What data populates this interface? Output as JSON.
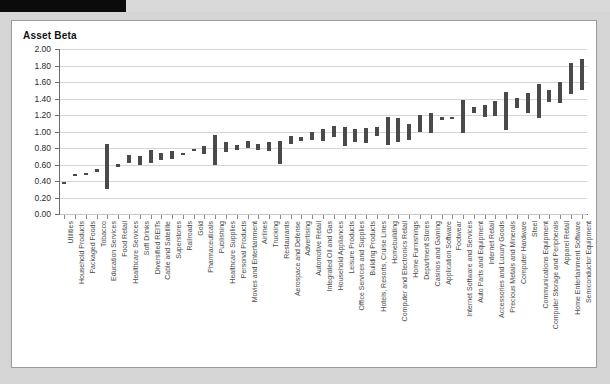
{
  "redaction": {
    "present": true
  },
  "figure": {
    "title": "Asset Beta"
  },
  "chart_data": {
    "type": "bar",
    "subtype": "floating-range-bar",
    "title": "Asset Beta",
    "xlabel": "",
    "ylabel": "Asset Beta",
    "ylim": [
      0.0,
      2.0
    ],
    "ytick_labels": [
      "0.00",
      "0.20",
      "0.40",
      "0.60",
      "0.80",
      "1.00",
      "1.20",
      "1.40",
      "1.60",
      "1.80",
      "2.00"
    ],
    "ytick_values": [
      0.0,
      0.2,
      0.4,
      0.6,
      0.8,
      1.0,
      1.2,
      1.4,
      1.6,
      1.8,
      2.0
    ],
    "grid": true,
    "legend": "none",
    "categories": [
      "Utilities",
      "Household Products",
      "Packaged Foods",
      "Tobacco",
      "Education Services",
      "Food Retail",
      "Healthcare Services",
      "Soft Drinks",
      "Diversified REITs",
      "Cable and Satellite",
      "Superstores",
      "Railroads",
      "Gold",
      "Pharmaceuticals",
      "Publishing",
      "Healthcare Supplies",
      "Personal Products",
      "Movies and Entertainment",
      "Airlines",
      "Trucking",
      "Restaurants",
      "Aerospace and Defense",
      "Advertising",
      "Automotive Retail",
      "Integrated Oil and Gas",
      "Household Appliances",
      "Leisure Products",
      "Office Services and Supplies",
      "Building Products",
      "Hotels, Resorts, Cruise Lines",
      "Homebuilding",
      "Computer and Electronics Retail",
      "Home Furnishings",
      "Department Stores",
      "Casinos and Gaming",
      "Application Software",
      "Footwear",
      "Internet Software and Services",
      "Auto Parts and Equipment",
      "Internet Retail",
      "Accessories and Luxury Goods",
      "Precious Metals and Minerals",
      "Computer Hardware",
      "Steel",
      "Communications Equipment",
      "Computer Storage and Peripherals",
      "Apparel Retail",
      "Home Entertainment Software",
      "Semiconductor Equipment"
    ],
    "series": [
      {
        "name": "low",
        "values": [
          0.37,
          0.46,
          0.47,
          0.51,
          0.3,
          0.57,
          0.62,
          0.59,
          0.62,
          0.65,
          0.67,
          0.71,
          0.76,
          0.73,
          0.59,
          0.75,
          0.77,
          0.8,
          0.78,
          0.76,
          0.6,
          0.85,
          0.88,
          0.9,
          0.89,
          0.93,
          0.83,
          0.87,
          0.86,
          0.95,
          0.84,
          0.87,
          0.9,
          1.0,
          0.98,
          1.14,
          1.16,
          0.98,
          1.23,
          1.17,
          1.19,
          1.02,
          1.29,
          1.22,
          1.16,
          1.36,
          1.35,
          1.46,
          1.5
        ]
      },
      {
        "name": "high",
        "values": [
          0.39,
          0.49,
          0.5,
          0.54,
          0.85,
          0.61,
          0.72,
          0.7,
          0.78,
          0.74,
          0.76,
          0.74,
          0.79,
          0.83,
          0.96,
          0.87,
          0.84,
          0.88,
          0.85,
          0.87,
          0.88,
          0.95,
          0.93,
          1.0,
          1.03,
          1.07,
          1.05,
          1.03,
          1.04,
          1.05,
          1.17,
          1.16,
          1.09,
          1.2,
          1.23,
          1.17,
          1.18,
          1.38,
          1.3,
          1.32,
          1.37,
          1.48,
          1.41,
          1.47,
          1.57,
          1.5,
          1.6,
          1.83,
          1.88
        ]
      }
    ]
  }
}
